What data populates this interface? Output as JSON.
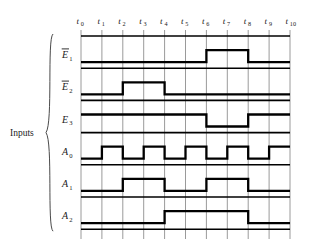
{
  "figure": {
    "type": "timing-diagram",
    "group_label": "Inputs",
    "time_axis": {
      "labels": [
        "t0",
        "t1",
        "t2",
        "t3",
        "t4",
        "t5",
        "t6",
        "t7",
        "t8",
        "t9",
        "t10"
      ],
      "base": "t",
      "subscripts": [
        "0",
        "1",
        "2",
        "3",
        "4",
        "5",
        "6",
        "7",
        "8",
        "9",
        "10"
      ],
      "interval_count": 10
    },
    "signals": [
      {
        "name": "E1bar",
        "base": "E",
        "subscript": "1",
        "overbar": true,
        "values": [
          0,
          0,
          0,
          0,
          0,
          0,
          1,
          1,
          0,
          0
        ]
      },
      {
        "name": "E2bar",
        "base": "E",
        "subscript": "2",
        "overbar": true,
        "values": [
          0,
          0,
          1,
          1,
          0,
          0,
          0,
          0,
          0,
          0
        ]
      },
      {
        "name": "E3",
        "base": "E",
        "subscript": "3",
        "overbar": false,
        "values": [
          1,
          1,
          1,
          1,
          1,
          1,
          0,
          0,
          1,
          1
        ]
      },
      {
        "name": "A0",
        "base": "A",
        "subscript": "0",
        "overbar": false,
        "values": [
          0,
          1,
          0,
          1,
          0,
          1,
          0,
          1,
          0,
          1
        ]
      },
      {
        "name": "A1",
        "base": "A",
        "subscript": "1",
        "overbar": false,
        "values": [
          0,
          0,
          1,
          1,
          0,
          0,
          1,
          1,
          0,
          0
        ]
      },
      {
        "name": "A2",
        "base": "A",
        "subscript": "2",
        "overbar": false,
        "values": [
          0,
          0,
          0,
          0,
          1,
          1,
          1,
          1,
          0,
          0
        ]
      }
    ],
    "colors": {
      "gridline": "#9a9a9a",
      "waveform": "#000000",
      "rowline": "#000000",
      "text": "#1a1a1a",
      "background": "#ffffff",
      "brace": "#4a4a4a"
    }
  }
}
